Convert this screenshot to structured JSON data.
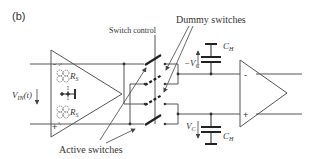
{
  "figure": {
    "panel_label": "(b)",
    "labels": {
      "switch_control": "Switch control",
      "dummy_switches": "Dummy switches",
      "active_switches": "Active switches",
      "input_voltage": "V",
      "input_voltage_sub": "IN",
      "input_voltage_arg": "(t)",
      "rs_top": "R",
      "rs_top_sub": "S",
      "rs_bottom": "R",
      "rs_bottom_sub": "S",
      "vc_neg": "−V",
      "vc_neg_sub": "C",
      "vc_pos": "V",
      "vc_pos_sub": "C",
      "ch_top": "C",
      "ch_top_sub": "H",
      "ch_bottom": "C",
      "ch_bottom_sub": "H",
      "left_amp_minus": "-",
      "left_amp_plus": "+",
      "right_amp_minus": "-",
      "right_amp_plus": "+"
    },
    "colors": {
      "stroke": "#444444",
      "text": "#333333",
      "background": "#ffffff"
    }
  }
}
